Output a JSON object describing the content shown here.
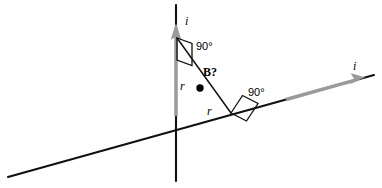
{
  "figure": {
    "type": "physics-diagram",
    "topic": "magnetic-field-from-two-perpendicular-current-carrying-wires",
    "background_color": "#ffffff",
    "line_color": "#000000",
    "arrow_color": "#9a9a9a",
    "width": 382,
    "height": 188
  },
  "labels": {
    "current_vertical": "i",
    "current_diagonal": "i",
    "angle_upper": "90°",
    "angle_lower": "90°",
    "distance_upper": "r",
    "distance_lower": "r",
    "field_point": "B?"
  },
  "geometry": {
    "vertical_wire": {
      "x": 176,
      "y_top": 5,
      "y_bottom": 181
    },
    "diagonal_wire": {
      "x1": 8,
      "y1": 177,
      "x2": 374,
      "y2": 75
    },
    "oblique_segment": {
      "x1": 177,
      "y1": 38,
      "x2": 231,
      "y2": 113
    },
    "field_point_dot": {
      "x": 200,
      "y": 88,
      "radius": 3.6
    },
    "vertical_current_arrow": {
      "x": 176,
      "y_tail": 116,
      "y_head": 25
    },
    "diagonal_current_arrow": {
      "x_tail": 286,
      "y_tail": 99,
      "x_head": 364,
      "y_head": 77
    },
    "right_angle_marker_upper": [
      [
        177,
        38
      ],
      [
        191,
        43
      ],
      [
        191,
        65
      ],
      [
        177,
        60
      ]
    ],
    "right_angle_marker_lower": [
      [
        231,
        113
      ],
      [
        243,
        95
      ],
      [
        258,
        103
      ],
      [
        246,
        121
      ]
    ]
  },
  "label_positions": {
    "current_vertical": {
      "left": 185,
      "top": 15
    },
    "current_diagonal": {
      "left": 353,
      "top": 61
    },
    "angle_upper": {
      "left": 193,
      "top": 42
    },
    "angle_lower": {
      "left": 246,
      "top": 88
    },
    "distance_upper": {
      "left": 180,
      "top": 80
    },
    "distance_lower": {
      "left": 206,
      "top": 104
    },
    "field_point": {
      "left": 203,
      "top": 66
    }
  }
}
